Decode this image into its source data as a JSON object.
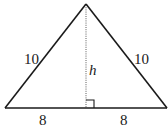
{
  "diagram": {
    "type": "isosceles-triangle",
    "side_labels": {
      "left_side": "10",
      "right_side": "10",
      "left_base_half": "8",
      "right_base_half": "8"
    },
    "altitude_label": "h",
    "right_angle_marker": true,
    "colors": {
      "stroke": "#1a1a1a",
      "background": "#ffffff"
    }
  }
}
